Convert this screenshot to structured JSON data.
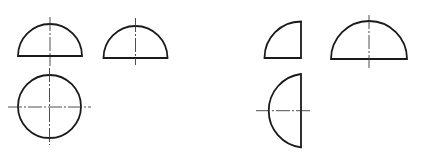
{
  "diagram": {
    "type": "orthographic-projection-views",
    "colors": {
      "background": "#ffffff",
      "outline": "#1a1a1a",
      "centerline": "#3a3a3a"
    },
    "groups": [
      {
        "name": "hemisphere-views",
        "views": [
          {
            "name": "front-view",
            "shape": "semicircle",
            "cx": 50,
            "base_y": 56,
            "r": 32,
            "centerlines": [
              {
                "orientation": "vertical",
                "x": 50,
                "from": 17,
                "to": 66
              }
            ]
          },
          {
            "name": "side-view",
            "shape": "semicircle",
            "cx": 135.5,
            "base_y": 58,
            "r": 32,
            "centerlines": [
              {
                "orientation": "vertical",
                "x": 135.5,
                "from": 18,
                "to": 65
              }
            ]
          },
          {
            "name": "top-view",
            "shape": "circle",
            "cx": 49.5,
            "cy": 106.5,
            "r": 31.5,
            "centerlines": [
              {
                "orientation": "horizontal",
                "y": 107,
                "from": 8,
                "to": 91
              },
              {
                "orientation": "vertical",
                "x": 49.5,
                "from": 68,
                "to": 145
              }
            ]
          }
        ]
      },
      {
        "name": "quarter-sphere-views",
        "views": [
          {
            "name": "front-view",
            "shape": "quarter-circle",
            "corner_x": 301,
            "corner_y": 58,
            "r": 36.5,
            "centerlines": []
          },
          {
            "name": "side-view",
            "shape": "semicircle",
            "cx": 369,
            "base_y": 59,
            "r": 38,
            "centerlines": [
              {
                "orientation": "vertical",
                "x": 369,
                "from": 15,
                "to": 68
              }
            ]
          },
          {
            "name": "top-view",
            "shape": "half-circle-left",
            "edge_x": 301,
            "cy": 110.7,
            "r": 37,
            "centerlines": [
              {
                "orientation": "horizontal",
                "y": 110.7,
                "from": 256,
                "to": 310
              }
            ]
          }
        ]
      }
    ]
  }
}
